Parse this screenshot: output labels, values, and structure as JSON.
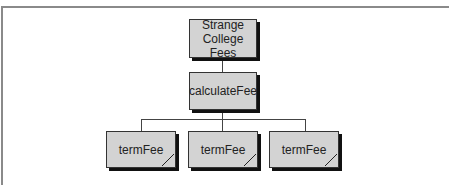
{
  "diagram": {
    "type": "structure-chart",
    "root": {
      "label_line1": "Strange",
      "label_line2": "College Fees"
    },
    "middle": {
      "label": "calculateFee"
    },
    "children": [
      {
        "label": "termFee"
      },
      {
        "label": "termFee"
      },
      {
        "label": "termFee"
      }
    ],
    "colors": {
      "box_fill": "#d3d3d3",
      "box_border": "#333333",
      "shadow": "#111111",
      "connector": "#444444",
      "frame": "#8a8a8a"
    }
  }
}
